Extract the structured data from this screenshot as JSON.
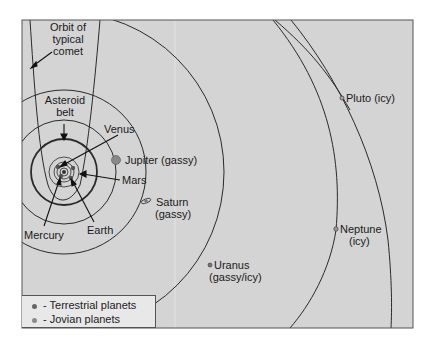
{
  "diagram": {
    "background": "#d4d4d4",
    "frame": {
      "x": 22,
      "y": 20,
      "width": 391,
      "height": 308
    },
    "sun_center": {
      "x": 64,
      "y": 172
    },
    "labels": {
      "comet": [
        "Orbit of",
        "typical",
        "comet"
      ],
      "asteroid_belt": [
        "Asteroid",
        "belt"
      ],
      "venus": "Venus",
      "jupiter": "Jupiter (gassy)",
      "mars": "Mars",
      "saturn": [
        "Saturn",
        "(gassy)"
      ],
      "mercury": "Mercury",
      "earth": "Earth",
      "uranus": [
        "Uranus",
        "(gassy/icy)"
      ],
      "neptune": [
        "Neptune",
        "(icy)"
      ],
      "pluto": "Pluto (icy)"
    },
    "planets": [
      {
        "name": "Mercury",
        "type": "terrestrial"
      },
      {
        "name": "Venus",
        "type": "terrestrial"
      },
      {
        "name": "Earth",
        "type": "terrestrial"
      },
      {
        "name": "Mars",
        "type": "terrestrial"
      },
      {
        "name": "Jupiter",
        "type": "jovian",
        "composition": "gassy"
      },
      {
        "name": "Saturn",
        "type": "jovian",
        "composition": "gassy"
      },
      {
        "name": "Uranus",
        "type": "jovian",
        "composition": "gassy/icy"
      },
      {
        "name": "Neptune",
        "type": "jovian",
        "composition": "icy"
      },
      {
        "name": "Pluto",
        "composition": "icy"
      }
    ],
    "legend": [
      {
        "label": "- Terrestrial planets",
        "color": "#666666"
      },
      {
        "label": "- Jovian planets",
        "color": "#8a8a8a"
      }
    ]
  }
}
